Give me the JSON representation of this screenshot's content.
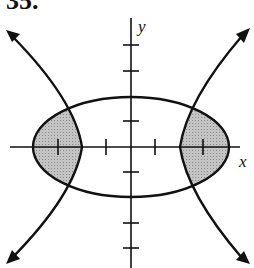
{
  "problem": {
    "number": "35."
  },
  "axes": {
    "x_label": "x",
    "y_label": "y"
  },
  "colors": {
    "stroke": "#111111",
    "shade": "#b8b8b8",
    "background": "#ffffff"
  },
  "figure": {
    "ellipse": {
      "center": [
        0,
        0
      ],
      "semi_major_x": 4,
      "semi_minor_y": 2
    },
    "hyperbola": {
      "orientation": "horizontal",
      "vertices": [
        [
          -2,
          0
        ],
        [
          2,
          0
        ]
      ]
    },
    "x_ticks": [
      -3,
      -1,
      1,
      3
    ],
    "y_ticks": [
      4,
      3,
      1,
      -1,
      -3,
      -4
    ],
    "shaded_regions": [
      "left lens",
      "right lens"
    ]
  }
}
